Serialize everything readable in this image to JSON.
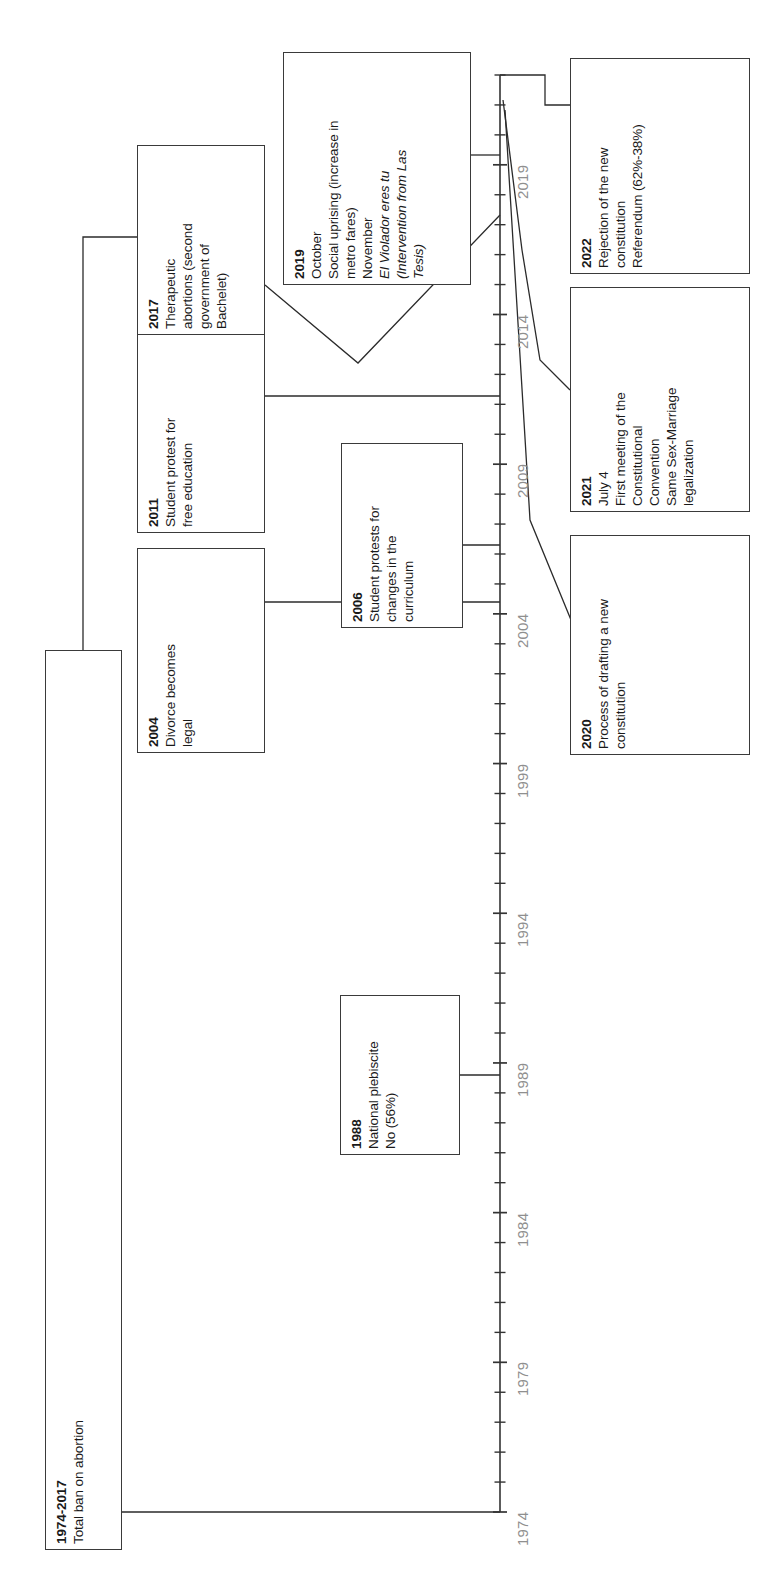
{
  "diagram": {
    "orientation": "vertical-axis-rotated-labels",
    "axis": {
      "name": "year-axis",
      "start_year": 1974,
      "end_year": 2022,
      "x": 500,
      "y_start": 1512,
      "y_end": 75,
      "tick_labels": [
        "1974",
        "1979",
        "1984",
        "1989",
        "1994",
        "1999",
        "2004",
        "2009",
        "2014",
        "2019"
      ],
      "label_years": [
        1974,
        1979,
        1984,
        1989,
        1994,
        1999,
        2004,
        2009,
        2014,
        2019
      ],
      "tick_color": "#333333",
      "label_color": "#8f8f8f"
    },
    "events": [
      {
        "id": "ban",
        "name": "event-1974-2017-abortion-ban",
        "year_label": "1974-2017",
        "lines": [
          "Total ban on abortion"
        ],
        "box": {
          "x": 45,
          "y": 650,
          "w": 77,
          "h": 900
        },
        "text_font_size": 13.5
      },
      {
        "id": "e1988",
        "name": "event-1988-plebiscite",
        "year_label": "1988",
        "lines": [
          "National plebiscite",
          "No (56%)"
        ],
        "box": {
          "x": 340,
          "y": 995,
          "w": 120,
          "h": 160
        },
        "text_font_size": 13.5
      },
      {
        "id": "e2004",
        "name": "event-2004-divorce",
        "year_label": "2004",
        "lines": [
          "Divorce becomes",
          "legal"
        ],
        "box": {
          "x": 137,
          "y": 548,
          "w": 128,
          "h": 205
        },
        "text_font_size": 13.5
      },
      {
        "id": "e2006",
        "name": "event-2006-student-protests",
        "year_label": "2006",
        "lines": [
          "Student protests for",
          "changes in the",
          "curriculum"
        ],
        "box": {
          "x": 341,
          "y": 443,
          "w": 122,
          "h": 185
        },
        "text_font_size": 13.5
      },
      {
        "id": "e2011",
        "name": "event-2011-student-protest",
        "year_label": "2011",
        "lines": [
          "Student protest for",
          "free education"
        ],
        "box": {
          "x": 137,
          "y": 332,
          "w": 128,
          "h": 201
        },
        "text_font_size": 13.5
      },
      {
        "id": "e2017",
        "name": "event-2017-therapeutic-abortions",
        "year_label": "2017",
        "lines": [
          "Therapeutic",
          "abortions (second",
          "government of",
          "Bachelet)"
        ],
        "box": {
          "x": 137,
          "y": 145,
          "w": 128,
          "h": 190
        },
        "text_font_size": 13.5
      },
      {
        "id": "e2019",
        "name": "event-2019-social-uprising",
        "year_label": "2019",
        "lines": [
          "October",
          "Social uprising (increase in",
          "metro fares)",
          "November",
          "El Violador eres tu",
          "(Intervention from Las",
          "Tesis)"
        ],
        "italic_lines": [
          4,
          5,
          6
        ],
        "box": {
          "x": 283,
          "y": 52,
          "w": 188,
          "h": 233
        },
        "text_font_size": 13.5
      },
      {
        "id": "e2020",
        "name": "event-2020-drafting-constitution",
        "year_label": "2020",
        "lines": [
          "Process of drafting a new",
          "constitution"
        ],
        "box": {
          "x": 570,
          "y": 535,
          "w": 180,
          "h": 220
        },
        "text_font_size": 13.5
      },
      {
        "id": "e2021",
        "name": "event-2021-constitutional-convention",
        "year_label": "2021",
        "lines": [
          "July 4",
          "First meeting of the",
          "Constitutional",
          "Convention",
          "Same Sex-Marriage",
          "legalization"
        ],
        "box": {
          "x": 570,
          "y": 287,
          "w": 180,
          "h": 225
        },
        "text_font_size": 13.5
      },
      {
        "id": "e2022",
        "name": "event-2022-referendum",
        "year_label": "2022",
        "lines": [
          "Rejection of the new",
          "constitution",
          "Referendum (62%-38%)"
        ],
        "box": {
          "x": 570,
          "y": 58,
          "w": 180,
          "h": 216
        },
        "text_font_size": 13.5
      }
    ],
    "connectors": [
      {
        "name": "connector-ban-to-axis-bottom",
        "d": "M 83 1550 L 83 1512 L 500 1512"
      },
      {
        "name": "connector-ban-to-2017",
        "d": "M 83 650 L 83 237 L 137 237"
      },
      {
        "name": "connector-1988-to-axis",
        "d": "M 460 1075 L 500 1075"
      },
      {
        "name": "connector-2004-to-axis",
        "d": "M 265 602 L 500 602"
      },
      {
        "name": "connector-2006-to-axis",
        "d": "M 463 545 L 500 545"
      },
      {
        "name": "connector-2011-to-axis",
        "d": "M 265 396 L 500 396"
      },
      {
        "name": "connector-2017-to-axis",
        "d": "M 265 285 L 358 363 L 500 215"
      },
      {
        "name": "connector-2019-to-axis",
        "d": "M 471 155 L 500 155"
      },
      {
        "name": "connector-2020-to-axis",
        "d": "M 578 637 L 530 520 L 505 110"
      },
      {
        "name": "connector-2021-to-axis",
        "d": "M 570 390 L 540 360 L 522 250 L 503 100"
      },
      {
        "name": "connector-2022-to-axis",
        "d": "M 500 75 L 545 75 L 545 105 L 570 105"
      }
    ],
    "colors": {
      "box_border": "#3a3a3a",
      "line": "#2b2b2b",
      "axis": "#333333",
      "tick_label": "#8f8f8f",
      "text": "#1a1a1a",
      "background": "#ffffff"
    }
  }
}
